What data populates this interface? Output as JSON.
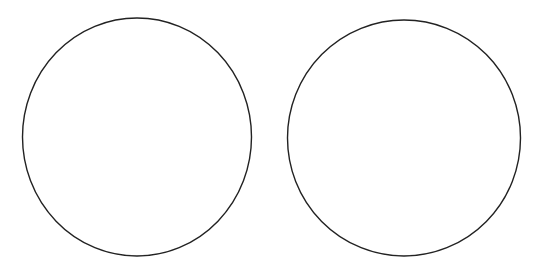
{
  "canvas": {
    "width": 538,
    "height": 272,
    "background": "#ffffff"
  },
  "shapes": [
    {
      "id": "circle-left",
      "type": "circle",
      "cx": 137,
      "cy": 137,
      "rx": 114.5,
      "ry": 119,
      "stroke": "#222222",
      "stroke_width": 1.4,
      "fill": "none"
    },
    {
      "id": "circle-right",
      "type": "circle",
      "cx": 404,
      "cy": 138,
      "rx": 116.5,
      "ry": 118,
      "stroke": "#222222",
      "stroke_width": 1.4,
      "fill": "none"
    }
  ]
}
